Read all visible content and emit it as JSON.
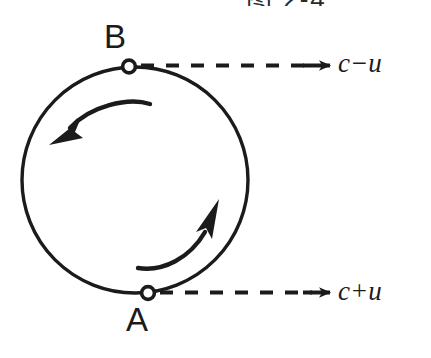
{
  "figure": {
    "caption_partial": "图 2-4",
    "background_color": "#ffffff",
    "ink_color": "#1b1b1b"
  },
  "circle": {
    "name": "ring-path",
    "center_x": 135,
    "center_y": 180,
    "radius": 113,
    "stroke_color": "#1b1b1b",
    "stroke_width": 3.2
  },
  "nodes": [
    {
      "id": "B",
      "label": "B",
      "marker": "open-circle",
      "x": 129,
      "y": 67,
      "label_x": 104,
      "label_y": 20
    },
    {
      "id": "A",
      "label": "A",
      "marker": "open-circle",
      "x": 148,
      "y": 293,
      "label_x": 126,
      "label_y": 303
    }
  ],
  "flows": [
    {
      "id": "top",
      "label": "c−u",
      "from_node": "B",
      "style": "dashed",
      "arrow": "right",
      "y": 66,
      "x_start": 140,
      "x_end": 330,
      "label_x": 338,
      "label_y": 50
    },
    {
      "id": "bottom",
      "label": "c+u",
      "from_node": "A",
      "style": "dashed",
      "arrow": "right",
      "y": 293,
      "x_start": 158,
      "x_end": 330,
      "label_x": 338,
      "label_y": 278
    }
  ],
  "curved_arrows": [
    {
      "id": "upper-ccw",
      "direction": "counterclockwise",
      "points_toward": "lower-left",
      "description": "curved arrow in upper half pointing left-down"
    },
    {
      "id": "lower-ccw",
      "direction": "counterclockwise",
      "points_toward": "upper-right",
      "description": "curved arrow in lower half pointing right-up"
    }
  ]
}
